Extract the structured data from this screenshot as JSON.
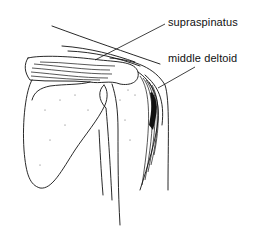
{
  "diagram": {
    "labels": [
      {
        "id": "supraspinatus",
        "text": "supraspinatus"
      },
      {
        "id": "middle-deltoid",
        "text": "middle deltoid"
      }
    ]
  }
}
